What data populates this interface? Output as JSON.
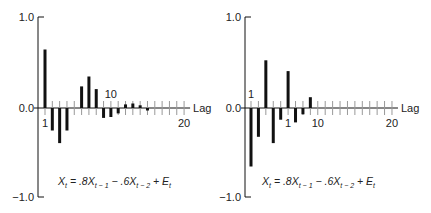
{
  "chart_data": [
    {
      "type": "bar",
      "title": "",
      "xlabel": "Lag",
      "ylabel": "",
      "ylim": [
        -1.0,
        1.0
      ],
      "yticks": [
        "1.0",
        "0.0",
        "-1.0"
      ],
      "x_tick_labels": [
        {
          "lag": 1,
          "text": "1",
          "pos": "below"
        },
        {
          "lag": 10,
          "text": "10",
          "pos": "above"
        },
        {
          "lag": 20,
          "text": "20",
          "pos": "below"
        }
      ],
      "categories": [
        1,
        2,
        3,
        4,
        5,
        6,
        7,
        8,
        9,
        10,
        11,
        12,
        13,
        14,
        15,
        16,
        17,
        18,
        19,
        20
      ],
      "values": [
        0.65,
        -0.25,
        -0.39,
        -0.25,
        0.0,
        0.24,
        0.35,
        0.21,
        -0.11,
        -0.1,
        -0.06,
        0.04,
        0.05,
        0.03,
        -0.02,
        0.0,
        0.0,
        0.0,
        0.0,
        0.0
      ],
      "annotation": "X_t = .8X_{t-1} − .6X_{t-2} + E_t",
      "grid": false,
      "legend": "none"
    },
    {
      "type": "bar",
      "title": "",
      "xlabel": "Lag",
      "ylabel": "",
      "ylim": [
        -1.0,
        1.0
      ],
      "yticks": [
        "1.0",
        "0.0",
        "-1.0"
      ],
      "x_tick_labels": [
        {
          "lag": 1,
          "text": "1",
          "pos": "above"
        },
        {
          "lag": 6,
          "text": "1",
          "pos": "below"
        },
        {
          "lag": 10,
          "text": "10",
          "pos": "below"
        },
        {
          "lag": 20,
          "text": "20",
          "pos": "below"
        }
      ],
      "categories": [
        1,
        2,
        3,
        4,
        5,
        6,
        7,
        8,
        9,
        10,
        11,
        12,
        13,
        14,
        15,
        16,
        17,
        18,
        19,
        20
      ],
      "values": [
        -0.65,
        -0.32,
        0.53,
        -0.39,
        -0.13,
        0.41,
        -0.16,
        -0.07,
        0.12,
        0.0,
        0.0,
        0.0,
        0.0,
        0.0,
        0.0,
        0.0,
        0.0,
        0.0,
        0.0,
        0.0
      ],
      "annotation": "X_t = .8X_{t-1} − .6X_{t-2} + E_t",
      "grid": false,
      "legend": "none"
    }
  ],
  "formula": {
    "x": "X",
    "t": "t",
    "eq": " = .8",
    "t1": "t − 1",
    "minus": " − .6",
    "t2": "t − 2",
    "plus": " + E"
  }
}
